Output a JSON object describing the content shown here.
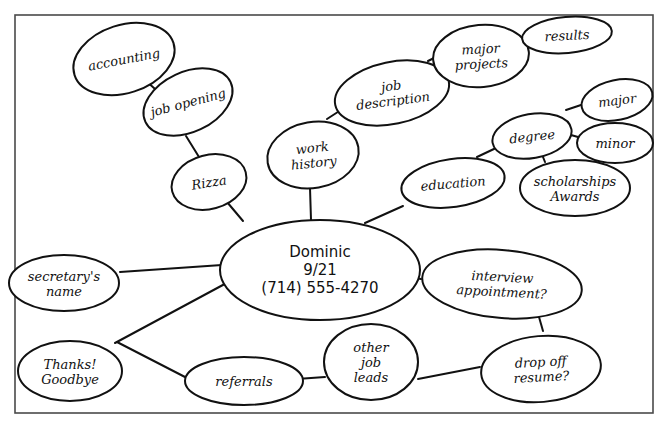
{
  "diagram": {
    "type": "mind-map",
    "style": "hand-drawn",
    "colors": {
      "ink": "#111111",
      "frame": "#4a4a4a",
      "background": "#ffffff"
    },
    "frame": {
      "x": 15,
      "y": 15,
      "width": 638,
      "height": 398
    },
    "center": {
      "id": "dominic",
      "lines": [
        "Dominic",
        "9/21",
        "(714) 555-4270"
      ],
      "cx": 320,
      "cy": 270,
      "rx": 100,
      "ry": 50
    },
    "nodes": [
      {
        "id": "accounting",
        "lines": [
          "accounting"
        ],
        "cx": 124,
        "cy": 59,
        "rx": 52,
        "ry": 34,
        "rotate": -18
      },
      {
        "id": "job-opening",
        "lines": [
          "job opening"
        ],
        "cx": 188,
        "cy": 102,
        "rx": 47,
        "ry": 30,
        "rotate": -25
      },
      {
        "id": "rizza",
        "lines": [
          "Rizza"
        ],
        "cx": 209,
        "cy": 182,
        "rx": 38,
        "ry": 27,
        "rotate": -15
      },
      {
        "id": "work-history",
        "lines": [
          "work",
          "history"
        ],
        "cx": 313,
        "cy": 155,
        "rx": 46,
        "ry": 33,
        "rotate": -10
      },
      {
        "id": "job-description",
        "lines": [
          "job",
          "description"
        ],
        "cx": 392,
        "cy": 93,
        "rx": 58,
        "ry": 31,
        "rotate": -12
      },
      {
        "id": "major-projects",
        "lines": [
          "major",
          "projects"
        ],
        "cx": 481,
        "cy": 56,
        "rx": 48,
        "ry": 31,
        "rotate": -5
      },
      {
        "id": "results",
        "lines": [
          "results"
        ],
        "cx": 567,
        "cy": 35,
        "rx": 45,
        "ry": 18,
        "rotate": -5
      },
      {
        "id": "degree",
        "lines": [
          "degree"
        ],
        "cx": 532,
        "cy": 136,
        "rx": 40,
        "ry": 22,
        "rotate": -10
      },
      {
        "id": "major",
        "lines": [
          "major"
        ],
        "cx": 617,
        "cy": 100,
        "rx": 36,
        "ry": 20,
        "rotate": -12
      },
      {
        "id": "minor",
        "lines": [
          "minor"
        ],
        "cx": 615,
        "cy": 143,
        "rx": 38,
        "ry": 20,
        "rotate": 0
      },
      {
        "id": "scholarships-awards",
        "lines": [
          "scholarships",
          "Awards"
        ],
        "cx": 575,
        "cy": 188,
        "rx": 55,
        "ry": 28,
        "rotate": 0
      },
      {
        "id": "education",
        "lines": [
          "education"
        ],
        "cx": 453,
        "cy": 183,
        "rx": 52,
        "ry": 24,
        "rotate": -8
      },
      {
        "id": "secretarys-name",
        "lines": [
          "secretary's",
          "name"
        ],
        "cx": 64,
        "cy": 283,
        "rx": 55,
        "ry": 28,
        "rotate": 0
      },
      {
        "id": "interview-appointment",
        "lines": [
          "interview",
          "appointment?"
        ],
        "cx": 502,
        "cy": 284,
        "rx": 80,
        "ry": 34,
        "rotate": 5
      },
      {
        "id": "drop-off-resume",
        "lines": [
          "drop off",
          "resume?"
        ],
        "cx": 541,
        "cy": 369,
        "rx": 60,
        "ry": 33,
        "rotate": -5
      },
      {
        "id": "thanks-goodbye",
        "lines": [
          "Thanks!",
          "Goodbye"
        ],
        "cx": 70,
        "cy": 371,
        "rx": 52,
        "ry": 30,
        "rotate": 0
      },
      {
        "id": "referrals",
        "lines": [
          "referrals"
        ],
        "cx": 244,
        "cy": 381,
        "rx": 59,
        "ry": 24,
        "rotate": 0
      },
      {
        "id": "other-job-leads",
        "lines": [
          "other",
          "job",
          "leads"
        ],
        "cx": 371,
        "cy": 362,
        "rx": 47,
        "ry": 38,
        "rotate": 0
      }
    ],
    "edges": [
      {
        "from": "accounting",
        "to": "job-opening",
        "x1": 145,
        "y1": 80,
        "x2": 164,
        "y2": 97
      },
      {
        "from": "job-opening",
        "to": "rizza",
        "x1": 186,
        "y1": 136,
        "x2": 199,
        "y2": 157
      },
      {
        "from": "rizza",
        "to": "dominic",
        "x1": 227,
        "y1": 202,
        "x2": 243,
        "y2": 221
      },
      {
        "from": "work-history",
        "to": "dominic",
        "x1": 310,
        "y1": 188,
        "x2": 311,
        "y2": 220
      },
      {
        "from": "work-history",
        "to": "job-description",
        "x1": 327,
        "y1": 119,
        "x2": 344,
        "y2": 108
      },
      {
        "from": "job-description",
        "to": "major-projects",
        "x1": 428,
        "y1": 61,
        "x2": 438,
        "y2": 56
      },
      {
        "from": "major-projects",
        "to": "results",
        "x1": 527,
        "y1": 45,
        "x2": 535,
        "y2": 44
      },
      {
        "from": "dominic",
        "to": "education",
        "x1": 365,
        "y1": 223,
        "x2": 403,
        "y2": 206
      },
      {
        "from": "education",
        "to": "degree",
        "x1": 477,
        "y1": 157,
        "x2": 496,
        "y2": 148
      },
      {
        "from": "degree",
        "to": "major",
        "x1": 566,
        "y1": 110,
        "x2": 581,
        "y2": 105
      },
      {
        "from": "degree",
        "to": "minor",
        "x1": 571,
        "y1": 135,
        "x2": 578,
        "y2": 137
      },
      {
        "from": "degree",
        "to": "scholarships-awards",
        "x1": 543,
        "y1": 157,
        "x2": 545,
        "y2": 162
      },
      {
        "from": "dominic",
        "to": "secretarys-name",
        "x1": 222,
        "y1": 265,
        "x2": 120,
        "y2": 272
      },
      {
        "from": "dominic",
        "to": "thanks-goodbye",
        "x1": 234,
        "y1": 279,
        "x2": 115,
        "y2": 343
      },
      {
        "from": "dominic",
        "to": "interview-appointment",
        "x1": 392,
        "y1": 274,
        "x2": 421,
        "y2": 279
      },
      {
        "from": "interview-appointment",
        "to": "drop-off-resume",
        "x1": 539,
        "y1": 317,
        "x2": 543,
        "y2": 331
      },
      {
        "from": "thanks-goodbye",
        "to": "referrals",
        "x1": 117,
        "y1": 342,
        "x2": 185,
        "y2": 377
      },
      {
        "from": "referrals",
        "to": "other-job-leads",
        "x1": 297,
        "y1": 379,
        "x2": 325,
        "y2": 377
      },
      {
        "from": "other-job-leads",
        "to": "drop-off-resume",
        "x1": 418,
        "y1": 379,
        "x2": 480,
        "y2": 367
      }
    ]
  }
}
